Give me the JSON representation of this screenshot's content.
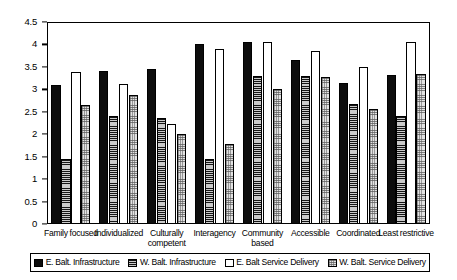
{
  "chart_data": {
    "type": "bar",
    "title": "",
    "subtitle": "",
    "xlabel": "",
    "ylabel": "",
    "ylim": [
      0,
      4.5
    ],
    "ytick_labels": [
      "4.5",
      "4",
      "3.5",
      "3",
      "2.5",
      "2",
      "1.5",
      "1",
      "0.5",
      "0"
    ],
    "ytick_values": [
      4.5,
      4,
      3.5,
      3,
      2.5,
      2,
      1.5,
      1,
      0.5,
      0
    ],
    "grid": false,
    "legend_position": "bottom",
    "categories": [
      "Family focused",
      "Individualized",
      "Culturally competent",
      "Interagency",
      "Community based",
      "Accessible",
      "Coordinated",
      "Least restrictive"
    ],
    "series": [
      {
        "name": "E. Balt. Infrastructure",
        "style": "solid-black",
        "color": "#0d0d0d",
        "values": [
          3.1,
          3.4,
          3.45,
          4.0,
          4.05,
          3.65,
          3.15,
          3.32
        ]
      },
      {
        "name": "W. Balt. Infrastructure",
        "style": "horizontal-hatch-dark-gray",
        "color": "#8a8a8a",
        "values": [
          1.45,
          2.4,
          2.36,
          1.45,
          3.3,
          3.3,
          2.68,
          2.4
        ]
      },
      {
        "name": "E. Balt Service Delivery",
        "style": "white-outline",
        "color": "#ffffff",
        "values": [
          3.38,
          3.13,
          2.23,
          3.9,
          4.05,
          3.85,
          3.5,
          4.05
        ]
      },
      {
        "name": "W. Balt. Service Delivery",
        "style": "stipple-light-gray",
        "color": "#e2e2e2",
        "values": [
          2.65,
          2.88,
          2.0,
          1.78,
          3.0,
          3.28,
          2.57,
          3.35
        ]
      }
    ]
  }
}
